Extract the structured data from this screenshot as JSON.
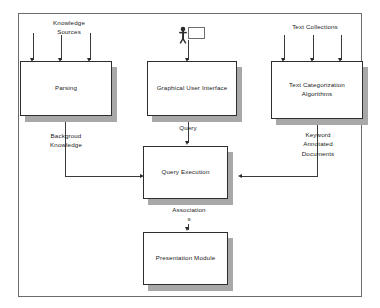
{
  "diagram": {
    "frame_color": "#6b6b6b",
    "box_border_color": "#2e2e2e",
    "shadow_color": "#a8a8a8",
    "line_color": "#3a3a3a",
    "inputs": [
      {
        "id": "knowledge-sources",
        "label": "Knowledge\nSources",
        "arrow_count": 3
      },
      {
        "id": "user-actor",
        "label": "",
        "arrow_count": 1
      },
      {
        "id": "text-collections",
        "label": "Text Collections",
        "arrow_count": 3
      }
    ],
    "nodes": [
      {
        "id": "parsing",
        "label": "Parsing"
      },
      {
        "id": "graphical-user-interface",
        "label": "Graphical User Interface"
      },
      {
        "id": "text-categorization-algorithms",
        "label": "Text Categorization\nAlgorithms"
      },
      {
        "id": "query-execution",
        "label": "Query Execution"
      },
      {
        "id": "presentation-module",
        "label": "Presentation Module"
      }
    ],
    "edge_labels": [
      {
        "id": "background-knowledge",
        "label": "Backgroud\nKnowledge"
      },
      {
        "id": "query",
        "label": "Query"
      },
      {
        "id": "keyword-annotated-documents",
        "label": "Keyword\nAnnotated\nDocuments"
      },
      {
        "id": "associations",
        "label": "Association\ns"
      }
    ],
    "icons": {
      "user_actor": "person-icon",
      "user_screen": "screen-icon"
    }
  }
}
